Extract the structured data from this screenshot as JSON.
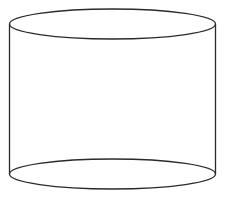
{
  "diagram": {
    "shape": "cylinder",
    "stroke_color": "#2a2a2a",
    "background_color": "#ffffff",
    "top_ellipse": {
      "cx": 112.5,
      "cy": 24,
      "rx": 103,
      "ry": 15
    },
    "bottom_ellipse": {
      "cx": 112.5,
      "cy": 174,
      "rx": 103,
      "ry": 15
    },
    "left_side": {
      "x": 9.5,
      "y1": 24,
      "y2": 174
    },
    "right_side": {
      "x": 215.5,
      "y1": 24,
      "y2": 174
    }
  }
}
